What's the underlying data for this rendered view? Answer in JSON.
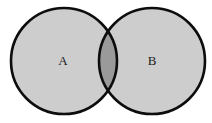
{
  "figure": {
    "name": "two-set-venn-diagram",
    "width": 212,
    "height": 123,
    "background_color": "#ffffff"
  },
  "style": {
    "set_fill_color": "#cdcdcd",
    "intersection_fill_color": "#9a9a9a",
    "stroke_color": "#0d0d0d",
    "stroke_width": 2.6,
    "label_color": "#1a1a1a",
    "label_font_size": 13
  },
  "sets": [
    {
      "id": "set-a",
      "label": "A",
      "cx": 64,
      "cy": 61,
      "r": 53,
      "label_x": 63,
      "label_y": 62,
      "fill": "#cdcdcd"
    },
    {
      "id": "set-b",
      "label": "B",
      "cx": 152,
      "cy": 61,
      "r": 53,
      "label_x": 152,
      "label_y": 62,
      "fill": "#cdcdcd"
    }
  ],
  "intersection": {
    "id": "set-a-intersect-b",
    "label": "",
    "fill": "#9a9a9a",
    "top_crossing_x": 108,
    "top_crossing_y": 20,
    "bottom_crossing_x": 108,
    "bottom_crossing_y": 102
  }
}
